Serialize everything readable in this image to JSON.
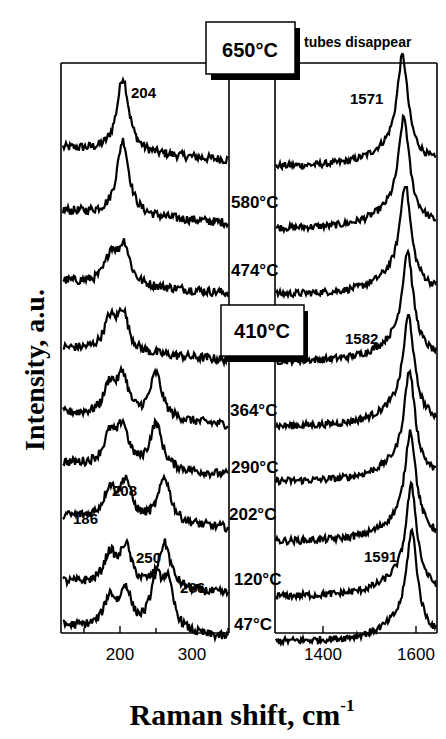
{
  "chart_data": {
    "type": "line",
    "title": "",
    "xlabel": "Raman shift, cm",
    "xlabel_superscript": "-1",
    "ylabel": "Intensity, a.u.",
    "panels": [
      {
        "name": "RBM region",
        "xlim": [
          140,
          345
        ],
        "xticks": [
          200,
          300
        ],
        "xtick_labels": [
          "200",
          "300"
        ],
        "peak_annotations": [
          {
            "label": "204",
            "x": 204,
            "series": "650°C"
          },
          {
            "label": "208",
            "x": 208,
            "series": "202°C"
          },
          {
            "label": "186",
            "x": 186,
            "series": "120°C"
          },
          {
            "label": "250",
            "x": 250,
            "series": "47°C"
          },
          {
            "label": "266",
            "x": 266,
            "series": "47°C"
          }
        ]
      },
      {
        "name": "G band region",
        "xlim": [
          1300,
          1630
        ],
        "xticks": [
          1400,
          1600
        ],
        "xtick_labels": [
          "1400",
          "1600"
        ],
        "peak_annotations": [
          {
            "label": "1571",
            "x": 1571,
            "series": "650°C"
          },
          {
            "label": "1582",
            "x": 1582,
            "series": "410°C"
          },
          {
            "label": "1591",
            "x": 1591,
            "series": "47°C"
          }
        ]
      }
    ],
    "series": [
      {
        "name": "650°C",
        "boxed": true,
        "note": "tubes disappear",
        "rbm_peaks": [
          204
        ],
        "g_peak": 1571
      },
      {
        "name": "580°C",
        "rbm_peaks": [
          204
        ],
        "g_peak": 1574
      },
      {
        "name": "474°C",
        "rbm_peaks": [
          188,
          206
        ],
        "g_peak": 1577
      },
      {
        "name": "410°C",
        "boxed": true,
        "rbm_peaks": [
          186,
          204
        ],
        "g_peak": 1582
      },
      {
        "name": "364°C",
        "rbm_peaks": [
          186,
          204,
          250
        ],
        "g_peak": 1584
      },
      {
        "name": "290°C",
        "rbm_peaks": [
          186,
          204,
          250
        ],
        "g_peak": 1586
      },
      {
        "name": "202°C",
        "rbm_peaks": [
          186,
          208,
          262
        ],
        "g_peak": 1588
      },
      {
        "name": "120°C",
        "rbm_peaks": [
          186,
          208,
          262
        ],
        "g_peak": 1590
      },
      {
        "name": "47°C",
        "rbm_peaks": [
          186,
          208,
          250,
          266
        ],
        "g_peak": 1591
      }
    ],
    "legend": "none (temperature labels inline between panels)",
    "grid": false
  },
  "labels": {
    "temp_650": "650°C",
    "tubes_disappear": "tubes disappear",
    "temp_580": "580°C",
    "temp_474": "474°C",
    "temp_410": "410°C",
    "temp_364": "364°C",
    "temp_290": "290°C",
    "temp_202": "202°C",
    "temp_120": "120°C",
    "temp_47": "47°C",
    "peak_204": "204",
    "peak_208": "208",
    "peak_186": "186",
    "peak_250": "250",
    "peak_266": "266",
    "peak_1571": "1571",
    "peak_1582": "1582",
    "peak_1591": "1591",
    "tick_200": "200",
    "tick_300": "300",
    "tick_1400": "1400",
    "tick_1600": "1600",
    "ylabel": "Intensity, a.u.",
    "xlabel": "Raman shift, cm",
    "xlabel_sup": "-1"
  }
}
